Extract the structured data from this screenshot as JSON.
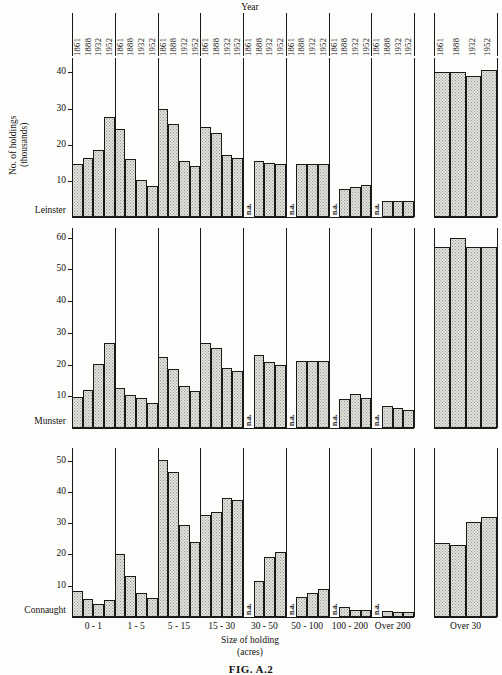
{
  "figure": {
    "caption": "FIG. A.2",
    "header_title": "Year",
    "y_axis_title_lines": [
      "No. of",
      "holdings",
      "(thousands)"
    ],
    "x_axis_title_lines": [
      "Size of holding",
      "(acres)"
    ],
    "na_label": "n.a."
  },
  "chart_data": {
    "type": "bar",
    "title": "FIG. A.2",
    "xlabel": "Size of holding (acres)",
    "ylabel": "No. of holdings (thousands)",
    "grid": false,
    "legend_position": "none",
    "series_label_axis": "Year",
    "years": [
      "1861",
      "1888",
      "1932",
      "1952"
    ],
    "categories": [
      "0 - 1",
      "1 - 5",
      "5 - 15",
      "15 - 30",
      "30 - 50",
      "50 - 100",
      "100 - 200",
      "Over 200"
    ],
    "extra_panel_category": "Over 30",
    "panels": [
      {
        "region": "Leinster",
        "ylim": [
          0,
          44
        ],
        "yticks": [
          10,
          20,
          30,
          40
        ],
        "main": {
          "0 - 1": [
            14.8,
            16.2,
            18.5,
            27.8
          ],
          "1 - 5": [
            24.3,
            16.0,
            10.3,
            8.5
          ],
          "5 - 15": [
            30.0,
            25.7,
            15.6,
            14.0
          ],
          "15 - 30": [
            25.0,
            23.2,
            17.2,
            16.3
          ],
          "30 - 50": [
            "n.a.",
            15.5,
            15.0,
            14.7
          ],
          "50 - 100": [
            "n.a.",
            14.7,
            14.7,
            14.7
          ],
          "100 - 200": [
            "n.a.",
            7.7,
            8.3,
            8.9
          ],
          "Over 200": [
            "n.a.",
            4.5,
            4.5,
            4.5
          ]
        },
        "over_30": [
          40.0,
          40.0,
          39.0,
          40.6
        ]
      },
      {
        "region": "Munster",
        "ylim": [
          0,
          63
        ],
        "yticks": [
          10,
          20,
          30,
          40,
          50,
          60
        ],
        "main": {
          "0 - 1": [
            9.7,
            11.9,
            20.2,
            26.7
          ],
          "1 - 5": [
            12.5,
            10.5,
            9.4,
            8.0
          ],
          "5 - 15": [
            22.5,
            18.5,
            13.2,
            11.8
          ],
          "15 - 30": [
            26.7,
            25.2,
            18.8,
            17.8
          ],
          "30 - 50": [
            "n.a.",
            23.0,
            20.8,
            19.7
          ],
          "50 - 100": [
            "n.a.",
            21.0,
            21.0,
            21.0
          ],
          "100 - 200": [
            "n.a.",
            9.0,
            10.8,
            9.6
          ],
          "Over 200": [
            "n.a.",
            6.8,
            6.2,
            5.6
          ]
        },
        "over_30": [
          57.0,
          60.0,
          57.0,
          57.0
        ]
      },
      {
        "region": "Connaught",
        "ylim": [
          0,
          54
        ],
        "yticks": [
          10,
          20,
          30,
          40,
          50
        ],
        "main": {
          "0 - 1": [
            8.2,
            5.8,
            4.1,
            5.5
          ],
          "1 - 5": [
            20.2,
            13.2,
            7.6,
            6.2
          ],
          "5 - 15": [
            50.3,
            46.3,
            29.5,
            24.0
          ],
          "15 - 30": [
            32.5,
            33.7,
            38.0,
            37.3
          ],
          "30 - 50": [
            "n.a.",
            11.5,
            19.2,
            20.7
          ],
          "50 - 100": [
            "n.a.",
            6.3,
            7.7,
            8.8
          ],
          "100 - 200": [
            "n.a.",
            3.3,
            2.3,
            2.3
          ],
          "Over 200": [
            "n.a.",
            2.0,
            1.5,
            1.5
          ]
        },
        "over_30": [
          23.5,
          23.0,
          30.5,
          32.0
        ]
      }
    ]
  }
}
